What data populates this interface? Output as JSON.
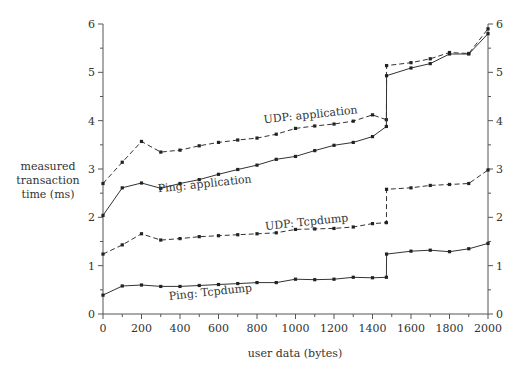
{
  "chart_data": {
    "type": "line",
    "title": "",
    "xlabel": "user data (bytes)",
    "ylabel": [
      "measured",
      "transaction",
      "time (ms)"
    ],
    "xlim": [
      0,
      2000
    ],
    "ylim": [
      0,
      6
    ],
    "xticks": [
      0,
      200,
      400,
      600,
      800,
      1000,
      1200,
      1400,
      1600,
      1800,
      2000
    ],
    "yticks": [
      0,
      1,
      2,
      3,
      4,
      5,
      6
    ],
    "grid": false,
    "right_axis_mirrored": true,
    "series": [
      {
        "name": "UDP: application",
        "style": "dashed",
        "x": [
          0,
          100,
          200,
          300,
          400,
          500,
          600,
          700,
          800,
          900,
          1000,
          1100,
          1200,
          1300,
          1400,
          1472,
          1473,
          1600,
          1700,
          1800,
          1900,
          2000
        ],
        "y": [
          2.7,
          3.14,
          3.57,
          3.35,
          3.39,
          3.48,
          3.55,
          3.6,
          3.64,
          3.72,
          3.84,
          3.89,
          3.93,
          3.99,
          4.12,
          4.02,
          5.14,
          5.2,
          5.28,
          5.41,
          5.39,
          5.9
        ]
      },
      {
        "name": "Ping: application",
        "style": "solid",
        "x": [
          0,
          100,
          200,
          300,
          400,
          500,
          600,
          700,
          800,
          900,
          1000,
          1100,
          1200,
          1300,
          1400,
          1472,
          1473,
          1600,
          1700,
          1800,
          1900,
          2000
        ],
        "y": [
          2.04,
          2.61,
          2.71,
          2.6,
          2.7,
          2.78,
          2.89,
          2.99,
          3.08,
          3.2,
          3.26,
          3.38,
          3.49,
          3.55,
          3.67,
          3.88,
          4.93,
          5.09,
          5.18,
          5.38,
          5.38,
          5.8
        ]
      },
      {
        "name": "UDP: Tcpdump",
        "style": "dashed",
        "x": [
          0,
          100,
          200,
          300,
          400,
          500,
          600,
          700,
          800,
          900,
          1000,
          1100,
          1200,
          1300,
          1400,
          1472,
          1473,
          1600,
          1700,
          1800,
          1900,
          2000
        ],
        "y": [
          1.24,
          1.43,
          1.66,
          1.53,
          1.56,
          1.6,
          1.62,
          1.64,
          1.66,
          1.68,
          1.75,
          1.76,
          1.77,
          1.8,
          1.87,
          1.89,
          2.58,
          2.61,
          2.66,
          2.68,
          2.7,
          2.98
        ]
      },
      {
        "name": "Ping: Tcpdump",
        "style": "solid",
        "x": [
          0,
          100,
          200,
          300,
          400,
          500,
          600,
          700,
          800,
          900,
          1000,
          1100,
          1200,
          1300,
          1400,
          1472,
          1473,
          1600,
          1700,
          1800,
          1900,
          2000
        ],
        "y": [
          0.39,
          0.58,
          0.6,
          0.57,
          0.57,
          0.59,
          0.61,
          0.63,
          0.65,
          0.65,
          0.72,
          0.71,
          0.72,
          0.76,
          0.75,
          0.76,
          1.24,
          1.3,
          1.32,
          1.29,
          1.35,
          1.46
        ]
      }
    ],
    "annotations": [
      {
        "text": "UDP: application",
        "x": 1080,
        "y": 4.05
      },
      {
        "text": "Ping: application",
        "x": 530,
        "y": 2.62
      },
      {
        "text": "UDP: Tcpdump",
        "x": 1060,
        "y": 1.83
      },
      {
        "text": "Ping: Tcpdump",
        "x": 560,
        "y": 0.38
      }
    ]
  }
}
